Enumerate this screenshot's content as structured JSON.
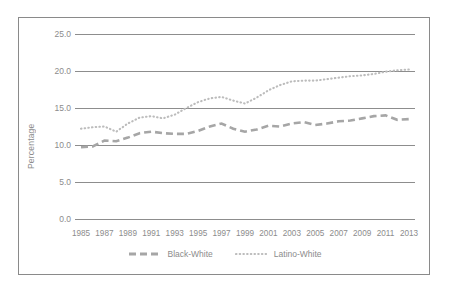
{
  "chart_data": {
    "type": "line",
    "title": "",
    "xlabel": "",
    "ylabel": "Percentage",
    "ylim": [
      0.0,
      25.0
    ],
    "xlim": [
      1985,
      2013
    ],
    "grid": true,
    "legend_position": "bottom",
    "y_ticks": [
      "25.0",
      "20.0",
      "15.0",
      "10.0",
      "5.0",
      "0.0"
    ],
    "y_tick_values": [
      25.0,
      20.0,
      15.0,
      10.0,
      5.0,
      0.0
    ],
    "x_tick_labels": [
      "1985",
      "1987",
      "1989",
      "1991",
      "1993",
      "1995",
      "1997",
      "1999",
      "2001",
      "2003",
      "2005",
      "2007",
      "2009",
      "2011",
      "2013"
    ],
    "x": [
      1985,
      1986,
      1987,
      1988,
      1989,
      1990,
      1991,
      1992,
      1993,
      1994,
      1995,
      1996,
      1997,
      1998,
      1999,
      2000,
      2001,
      2002,
      2003,
      2004,
      2005,
      2006,
      2007,
      2008,
      2009,
      2010,
      2011,
      2012,
      2013
    ],
    "series": [
      {
        "name": "Black-White",
        "style": "dashed",
        "color": "#a6a6a6",
        "values": [
          9.7,
          9.8,
          10.6,
          10.5,
          11.0,
          11.6,
          11.8,
          11.6,
          11.5,
          11.5,
          11.9,
          12.5,
          12.9,
          12.2,
          11.8,
          12.1,
          12.6,
          12.5,
          12.9,
          13.1,
          12.7,
          12.9,
          13.2,
          13.3,
          13.6,
          13.9,
          14.0,
          13.4,
          13.5
        ]
      },
      {
        "name": "Latino-White",
        "style": "dotted",
        "color": "#bcbcbc",
        "values": [
          12.2,
          12.4,
          12.5,
          11.8,
          12.9,
          13.7,
          13.9,
          13.6,
          14.1,
          15.0,
          15.8,
          16.3,
          16.5,
          16.0,
          15.6,
          16.4,
          17.4,
          18.1,
          18.6,
          18.7,
          18.7,
          18.9,
          19.1,
          19.3,
          19.4,
          19.6,
          19.9,
          20.1,
          20.2
        ]
      }
    ]
  },
  "legend": {
    "items": [
      {
        "label": "Black-White",
        "marker": "dashed-line-swatch"
      },
      {
        "label": "Latino-White",
        "marker": "dotted-line-swatch"
      }
    ]
  }
}
